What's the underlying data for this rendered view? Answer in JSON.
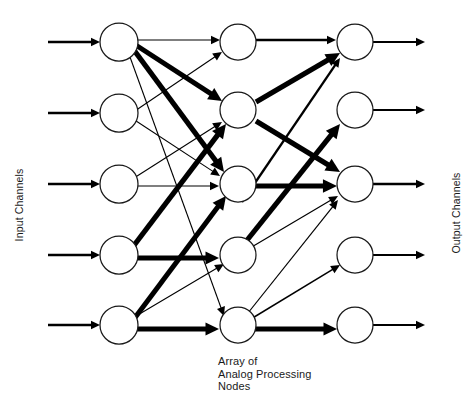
{
  "figure": {
    "background_color": "#ffffff",
    "stroke_color": "#000000",
    "width": 476,
    "height": 416
  },
  "labels": {
    "input_channels": "Input Channels",
    "output_channels": "Output Channels",
    "array_caption": "Array of\nAnalog Processing\nNodes"
  },
  "layers": [
    {
      "name": "input-layer",
      "cx": 119,
      "r": 19,
      "nodes": [
        {
          "id": "in-1",
          "cy": 42
        },
        {
          "id": "in-2",
          "cy": 113
        },
        {
          "id": "in-3",
          "cy": 184
        },
        {
          "id": "in-4",
          "cy": 255
        },
        {
          "id": "in-5",
          "cy": 325
        }
      ]
    },
    {
      "name": "processing-layer",
      "cx": 238,
      "r": 18,
      "nodes": [
        {
          "id": "mid-1",
          "cy": 42
        },
        {
          "id": "mid-2",
          "cy": 110
        },
        {
          "id": "mid-3",
          "cy": 184
        },
        {
          "id": "mid-4",
          "cy": 255
        },
        {
          "id": "mid-5",
          "cy": 325
        }
      ]
    },
    {
      "name": "output-layer",
      "cx": 355,
      "r": 18,
      "nodes": [
        {
          "id": "out-1",
          "cy": 42
        },
        {
          "id": "out-2",
          "cy": 110
        },
        {
          "id": "out-3",
          "cy": 184
        },
        {
          "id": "out-4",
          "cy": 255
        },
        {
          "id": "out-5",
          "cy": 325
        }
      ]
    }
  ],
  "input_feeds": [
    {
      "id": "feed-1",
      "x1": 48,
      "x2": 100,
      "y": 42,
      "width": 2.6
    },
    {
      "id": "feed-2",
      "x1": 48,
      "x2": 100,
      "y": 113,
      "width": 2.6
    },
    {
      "id": "feed-3",
      "x1": 48,
      "x2": 100,
      "y": 184,
      "width": 2.6
    },
    {
      "id": "feed-4",
      "x1": 48,
      "x2": 100,
      "y": 255,
      "width": 2.6
    },
    {
      "id": "feed-5",
      "x1": 48,
      "x2": 100,
      "y": 325,
      "width": 2.6
    }
  ],
  "output_feeds": [
    {
      "id": "out-feed-1",
      "x1": 373,
      "x2": 425,
      "y": 42,
      "width": 2.0
    },
    {
      "id": "out-feed-2",
      "x1": 373,
      "x2": 425,
      "y": 110,
      "width": 2.0
    },
    {
      "id": "out-feed-3",
      "x1": 373,
      "x2": 425,
      "y": 184,
      "width": 2.6
    },
    {
      "id": "out-feed-4",
      "x1": 373,
      "x2": 425,
      "y": 255,
      "width": 2.0
    },
    {
      "id": "out-feed-5",
      "x1": 373,
      "x2": 425,
      "y": 325,
      "width": 2.0
    }
  ],
  "connections": [
    {
      "id": "in1-mid1",
      "from": "in-1",
      "to": "mid-1",
      "x1": 128,
      "y1": 40,
      "x2": 220,
      "y2": 40,
      "width": 1.1,
      "weight": "low"
    },
    {
      "id": "in1-mid2",
      "from": "in-1",
      "to": "mid-2",
      "x1": 128,
      "y1": 40,
      "x2": 222,
      "y2": 101,
      "width": 5.0,
      "weight": "high"
    },
    {
      "id": "in1-mid3",
      "from": "in-1",
      "to": "mid-3",
      "x1": 128,
      "y1": 42,
      "x2": 224,
      "y2": 172,
      "width": 5.2,
      "weight": "high"
    },
    {
      "id": "in1-mid5",
      "from": "in-1",
      "to": "mid-5",
      "x1": 126,
      "y1": 46,
      "x2": 224,
      "y2": 316,
      "width": 1.1,
      "weight": "low"
    },
    {
      "id": "in2-mid1",
      "from": "in-2",
      "to": "mid-1",
      "x1": 126,
      "y1": 117,
      "x2": 222,
      "y2": 52,
      "width": 1.1,
      "weight": "low"
    },
    {
      "id": "in2-mid3",
      "from": "in-2",
      "to": "mid-3",
      "x1": 130,
      "y1": 117,
      "x2": 220,
      "y2": 176,
      "width": 1.1,
      "weight": "low"
    },
    {
      "id": "in3-mid2",
      "from": "in-3",
      "to": "mid-2",
      "x1": 134,
      "y1": 178,
      "x2": 222,
      "y2": 122,
      "width": 1.1,
      "weight": "low"
    },
    {
      "id": "in3-mid3",
      "from": "in-3",
      "to": "mid-3",
      "x1": 138,
      "y1": 186,
      "x2": 219,
      "y2": 186,
      "width": 1.1,
      "weight": "low"
    },
    {
      "id": "in4-mid2",
      "from": "in-4",
      "to": "mid-2",
      "x1": 132,
      "y1": 248,
      "x2": 226,
      "y2": 124,
      "width": 5.2,
      "weight": "high"
    },
    {
      "id": "in4-mid4",
      "from": "in-4",
      "to": "mid-4",
      "x1": 136,
      "y1": 258,
      "x2": 219,
      "y2": 258,
      "width": 5.0,
      "weight": "high"
    },
    {
      "id": "in5-mid3",
      "from": "in-5",
      "to": "mid-3",
      "x1": 128,
      "y1": 327,
      "x2": 226,
      "y2": 196,
      "width": 5.0,
      "weight": "high"
    },
    {
      "id": "in5-mid4",
      "from": "in-5",
      "to": "mid-4",
      "x1": 126,
      "y1": 322,
      "x2": 224,
      "y2": 264,
      "width": 1.1,
      "weight": "low"
    },
    {
      "id": "in5-mid5",
      "from": "in-5",
      "to": "mid-5",
      "x1": 130,
      "y1": 329,
      "x2": 219,
      "y2": 329,
      "width": 5.0,
      "weight": "high"
    },
    {
      "id": "mid1-out1",
      "from": "mid-1",
      "to": "out-1",
      "x1": 256,
      "y1": 40,
      "x2": 336,
      "y2": 40,
      "width": 2.6,
      "weight": "medium"
    },
    {
      "id": "mid2-out1",
      "from": "mid-2",
      "to": "out-1",
      "x1": 256,
      "y1": 102,
      "x2": 340,
      "y2": 53,
      "width": 5.2,
      "weight": "high"
    },
    {
      "id": "mid2-out3",
      "from": "mid-2",
      "to": "out-3",
      "x1": 256,
      "y1": 121,
      "x2": 340,
      "y2": 172,
      "width": 5.2,
      "weight": "high"
    },
    {
      "id": "mid3-out1",
      "from": "mid-3",
      "to": "out-1",
      "x1": 242,
      "y1": 202,
      "x2": 340,
      "y2": 58,
      "width": 2.3,
      "weight": "medium"
    },
    {
      "id": "mid3-out3",
      "from": "mid-3",
      "to": "out-3",
      "x1": 246,
      "y1": 186,
      "x2": 337,
      "y2": 186,
      "width": 5.2,
      "weight": "high"
    },
    {
      "id": "mid4-out2",
      "from": "mid-4",
      "to": "out-2",
      "x1": 244,
      "y1": 244,
      "x2": 340,
      "y2": 124,
      "width": 5.2,
      "weight": "high"
    },
    {
      "id": "mid4-out3",
      "from": "mid-4",
      "to": "out-3",
      "x1": 250,
      "y1": 248,
      "x2": 338,
      "y2": 196,
      "width": 1.2,
      "weight": "low"
    },
    {
      "id": "mid5-out3",
      "from": "mid-5",
      "to": "out-3",
      "x1": 244,
      "y1": 318,
      "x2": 338,
      "y2": 200,
      "width": 1.2,
      "weight": "low"
    },
    {
      "id": "mid5-out4",
      "from": "mid-5",
      "to": "out-4",
      "x1": 246,
      "y1": 322,
      "x2": 340,
      "y2": 265,
      "width": 1.5,
      "weight": "low"
    },
    {
      "id": "mid5-out5",
      "from": "mid-5",
      "to": "out-5",
      "x1": 244,
      "y1": 329,
      "x2": 337,
      "y2": 329,
      "width": 5.0,
      "weight": "high"
    }
  ]
}
